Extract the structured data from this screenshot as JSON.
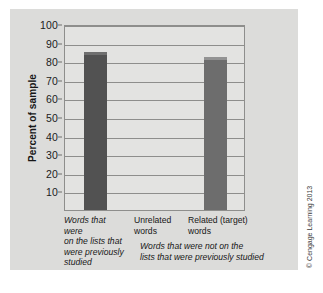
{
  "chart_data": {
    "type": "bar",
    "title": "",
    "xlabel": "",
    "ylabel": "Percent of sample",
    "ylim": [
      0,
      100
    ],
    "ytick_step": 10,
    "yticks": [
      100,
      90,
      80,
      70,
      60,
      50,
      40,
      30,
      20,
      10
    ],
    "grid": true,
    "legend": false,
    "categories": [
      "Words that were on the lists that were previously studied",
      "Unrelated words",
      "Related (target) words"
    ],
    "values": [
      85,
      0,
      82
    ],
    "bar_colors": [
      "#525252",
      "#6d6d6d",
      "#6d6d6d"
    ],
    "annotations": [
      "Words that were not on the lists that were previously studied"
    ]
  },
  "axis": {
    "y_title": "Percent of sample",
    "y_tick_labels": [
      "100",
      "90",
      "80",
      "70",
      "60",
      "50",
      "40",
      "30",
      "20",
      "10"
    ]
  },
  "categories": [
    {
      "label": "Words that were\non the lists that\nwere previously\nstudied",
      "style": "italic"
    },
    {
      "label": "Unrelated\nwords",
      "style": "normal"
    },
    {
      "label": "Related (target)\nwords",
      "style": "normal"
    }
  ],
  "caption": "Words that were not on the\nlists that were previously studied",
  "credit": "© Cengage Learning 2013",
  "colors": {
    "panel_background": "#dcdcda",
    "plot_background": "#e3e3e1",
    "grid": "#8e8e8c",
    "bar_dark": "#525252",
    "bar_light": "#6d6d6d",
    "text": "#171717"
  }
}
